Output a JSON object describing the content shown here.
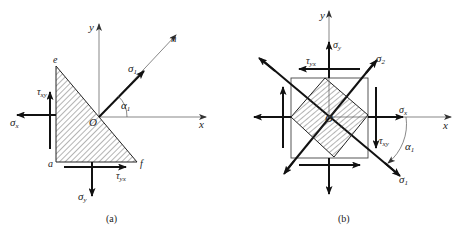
{
  "figure": {
    "panel_a": {
      "caption": "(a)",
      "axis_x": "x",
      "axis_y": "y",
      "normal": "n",
      "origin": "O",
      "vertices": {
        "e": "e",
        "a": "a",
        "f": "f"
      },
      "labels": {
        "sigma_1": "σ",
        "sigma_1_sub": "1",
        "alpha_1": "α",
        "alpha_1_sub": "1",
        "sigma_x": "σ",
        "sigma_x_sub": "x",
        "sigma_y": "σ",
        "sigma_y_sub": "y",
        "tau_xy": "τ",
        "tau_xy_sub": "xy",
        "tau_yx": "τ",
        "tau_yx_sub": "yx"
      }
    },
    "panel_b": {
      "caption": "(b)",
      "axis_x": "x",
      "axis_y": "y",
      "origin": "O",
      "labels": {
        "sigma_1": "σ",
        "sigma_1_sub": "1",
        "sigma_2": "σ",
        "sigma_2_sub": "2",
        "alpha_1": "α",
        "alpha_1_sub": "1",
        "sigma_x": "σ",
        "sigma_x_sub": "x",
        "sigma_y": "σ",
        "sigma_y_sub": "y",
        "tau_xy": "τ",
        "tau_xy_sub": "xy",
        "tau_yx": "τ",
        "tau_yx_sub": "yx"
      }
    },
    "colors": {
      "line": "#222222",
      "thin": "#555555",
      "hatch": "#444444",
      "background": "#ffffff"
    }
  }
}
